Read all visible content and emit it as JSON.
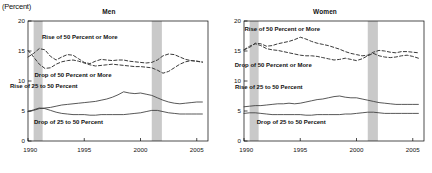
{
  "unit_label": "(Percent)",
  "chart_data": [
    {
      "type": "line",
      "title": "Men",
      "xlabel": "",
      "ylabel": "",
      "unit": "(Percent)",
      "xlim": [
        1990,
        2006
      ],
      "ylim": [
        0,
        20
      ],
      "yticks": [
        0,
        5,
        10,
        15,
        20
      ],
      "xticks": [
        1990,
        1995,
        2000,
        2005
      ],
      "grid": false,
      "legend": "inline-annotations",
      "shaded_regions": [
        {
          "name": "recession-1990",
          "start": 1990.5,
          "end": 1991.3
        },
        {
          "name": "recession-2001",
          "start": 2001.0,
          "end": 2001.9
        }
      ],
      "x": [
        1990,
        1990.5,
        1991,
        1991.5,
        1992,
        1992.5,
        1993,
        1993.5,
        1994,
        1994.5,
        1995,
        1995.5,
        1996,
        1996.5,
        1997,
        1997.5,
        1998,
        1998.5,
        1999,
        1999.5,
        2000,
        2000.5,
        2001,
        2001.5,
        2002,
        2002.5,
        2003,
        2003.5,
        2004,
        2004.5,
        2005,
        2005.5
      ],
      "series": [
        {
          "name": "Rise of 50 Percent or More",
          "style": "dashed",
          "values": [
            14.0,
            14.6,
            15.4,
            15.2,
            14.1,
            13.5,
            14.0,
            14.4,
            14.3,
            13.7,
            13.1,
            12.9,
            13.3,
            13.6,
            13.5,
            13.4,
            13.5,
            13.5,
            13.3,
            13.2,
            13.1,
            13.0,
            13.1,
            13.5,
            14.2,
            14.5,
            14.4,
            14.0,
            13.6,
            13.4,
            13.3,
            13.1
          ]
        },
        {
          "name": "Drop of 50 Percent or More",
          "style": "dashed",
          "values": [
            15.1,
            14.0,
            12.8,
            12.1,
            12.2,
            12.8,
            13.2,
            13.4,
            13.5,
            13.3,
            13.0,
            12.7,
            12.5,
            12.6,
            12.7,
            12.8,
            12.7,
            12.6,
            12.5,
            12.4,
            12.4,
            12.3,
            12.2,
            11.8,
            11.3,
            11.6,
            12.2,
            12.8,
            13.2,
            13.4,
            13.3,
            13.2
          ]
        },
        {
          "name": "Rise of 25 to 50 Percent",
          "style": "solid",
          "values": [
            4.9,
            5.1,
            5.4,
            5.5,
            5.6,
            5.8,
            6.0,
            6.1,
            6.2,
            6.3,
            6.4,
            6.5,
            6.6,
            6.8,
            7.0,
            7.3,
            7.7,
            8.2,
            8.0,
            7.9,
            8.0,
            7.8,
            7.6,
            7.2,
            6.8,
            6.5,
            6.3,
            6.2,
            6.3,
            6.4,
            6.5,
            6.5
          ]
        },
        {
          "name": "Drop of 25 to 50 Percent",
          "style": "solid",
          "values": [
            4.9,
            5.2,
            5.5,
            5.4,
            5.1,
            4.8,
            4.6,
            4.5,
            4.4,
            4.4,
            4.4,
            4.3,
            4.3,
            4.4,
            4.4,
            4.4,
            4.4,
            4.4,
            4.5,
            4.6,
            4.7,
            4.9,
            5.1,
            5.1,
            4.9,
            4.7,
            4.6,
            4.5,
            4.5,
            4.5,
            4.5,
            4.5
          ]
        }
      ]
    },
    {
      "type": "line",
      "title": "Women",
      "xlabel": "",
      "ylabel": "",
      "unit": "(Percent)",
      "xlim": [
        1990,
        2006
      ],
      "ylim": [
        0,
        20
      ],
      "yticks": [
        0,
        5,
        10,
        15,
        20
      ],
      "xticks": [
        1990,
        1995,
        2000,
        2005
      ],
      "grid": false,
      "legend": "inline-annotations",
      "shaded_regions": [
        {
          "name": "recession-1990",
          "start": 1990.5,
          "end": 1991.3
        },
        {
          "name": "recession-2001",
          "start": 2001.0,
          "end": 2001.9
        }
      ],
      "x": [
        1990,
        1990.5,
        1991,
        1991.5,
        1992,
        1992.5,
        1993,
        1993.5,
        1994,
        1994.5,
        1995,
        1995.5,
        1996,
        1996.5,
        1997,
        1997.5,
        1998,
        1998.5,
        1999,
        1999.5,
        2000,
        2000.5,
        2001,
        2001.5,
        2002,
        2002.5,
        2003,
        2003.5,
        2004,
        2004.5,
        2005,
        2005.5
      ],
      "series": [
        {
          "name": "Rise of 50 Percent or More",
          "style": "dashed",
          "values": [
            15.2,
            15.6,
            16.3,
            16.2,
            15.8,
            15.9,
            16.2,
            16.4,
            16.6,
            16.9,
            17.3,
            17.0,
            16.6,
            16.3,
            16.1,
            15.9,
            15.6,
            15.3,
            14.9,
            14.6,
            14.4,
            14.2,
            14.3,
            14.8,
            15.1,
            15.0,
            14.8,
            14.7,
            14.9,
            14.9,
            14.8,
            14.7
          ]
        },
        {
          "name": "Drop of 50 Percent or More",
          "style": "dashed",
          "values": [
            15.2,
            15.8,
            16.2,
            15.9,
            15.4,
            15.2,
            15.1,
            14.9,
            14.7,
            14.5,
            14.3,
            14.2,
            14.2,
            14.1,
            13.9,
            13.7,
            13.5,
            13.6,
            13.8,
            13.6,
            13.4,
            13.7,
            14.2,
            14.6,
            14.2,
            14.0,
            13.9,
            14.0,
            14.2,
            14.3,
            14.1,
            13.8
          ]
        },
        {
          "name": "Rise of 25 to 50 Percent",
          "style": "solid",
          "values": [
            5.7,
            5.8,
            5.9,
            5.9,
            6.0,
            6.1,
            6.2,
            6.2,
            6.3,
            6.2,
            6.3,
            6.5,
            6.7,
            6.9,
            7.0,
            7.2,
            7.4,
            7.5,
            7.3,
            7.2,
            7.2,
            7.0,
            6.8,
            6.6,
            6.4,
            6.3,
            6.2,
            6.1,
            6.1,
            6.1,
            6.1,
            6.1
          ]
        },
        {
          "name": "Drop of 25 to 50 Percent",
          "style": "solid",
          "values": [
            4.6,
            4.7,
            4.7,
            4.6,
            4.5,
            4.4,
            4.4,
            4.4,
            4.4,
            4.4,
            4.4,
            4.3,
            4.3,
            4.4,
            4.4,
            4.4,
            4.4,
            4.4,
            4.5,
            4.5,
            4.6,
            4.7,
            4.8,
            4.8,
            4.7,
            4.6,
            4.6,
            4.6,
            4.6,
            4.6,
            4.6,
            4.6
          ]
        }
      ],
      "annotations": [
        "Rise of 50 Percent or More",
        "Drop of 50 Percent or More",
        "Rise of 25 to 50 Percent",
        "Drop of 25 to 50 Percent"
      ]
    }
  ],
  "colors": {
    "line": "#3a3a3a",
    "axis": "#000000",
    "shading": "#c9c9c9",
    "text": "#111111"
  }
}
